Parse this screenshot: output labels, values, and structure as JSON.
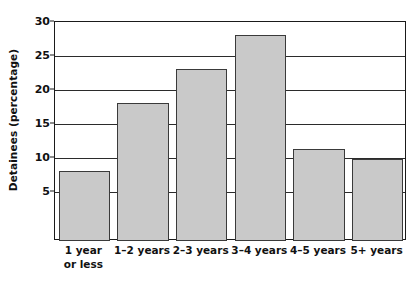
{
  "chart_data": {
    "type": "bar",
    "title": "",
    "xlabel": "",
    "ylabel": "Detainees (percentage)",
    "categories": [
      "1 year or less",
      "1–2 years",
      "2–3 years",
      "3–4 years",
      "4–5 years",
      "5+ years"
    ],
    "category_lines": [
      [
        "1 year",
        "or less"
      ],
      [
        "1–2 years",
        ""
      ],
      [
        "2–3 years",
        ""
      ],
      [
        "3–4 years",
        ""
      ],
      [
        "4–5 years",
        ""
      ],
      [
        "5+ years",
        ""
      ]
    ],
    "values": [
      8.1,
      18.1,
      23.1,
      28.1,
      11.4,
      9.8
    ],
    "ylim": [
      0,
      30
    ],
    "yticks": [
      5,
      10,
      15,
      20,
      25,
      30
    ],
    "ytick_labels": [
      "5",
      "10",
      "15",
      "20",
      "25",
      "30"
    ],
    "grid": "horizontal",
    "legend": "none",
    "bar_fill_color": "#c9c9c9",
    "bar_edge_color": "#3a3a3a",
    "axis_color": "#1a1a1a",
    "gridline_color": "#2b2b2b",
    "background_color": "#ffffff"
  }
}
